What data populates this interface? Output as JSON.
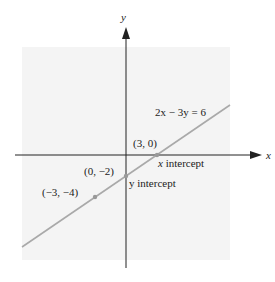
{
  "diagram": {
    "axes": {
      "x_label": "x",
      "y_label": "y"
    },
    "equation": "2x − 3y = 6",
    "points": [
      {
        "name": "x-intercept",
        "coords": "(3, 0)",
        "annotation_var": "x",
        "annotation_text": " intercept"
      },
      {
        "name": "y-intercept",
        "coords": "(0, −2)",
        "annotation_var": "y",
        "annotation_text": " intercept"
      },
      {
        "name": "point",
        "coords": "(−3, −4)"
      }
    ],
    "colors": {
      "line": "#a9a9a9",
      "axis": "#222222",
      "background_panel": "#f3f3f3",
      "point": "#999999"
    }
  }
}
